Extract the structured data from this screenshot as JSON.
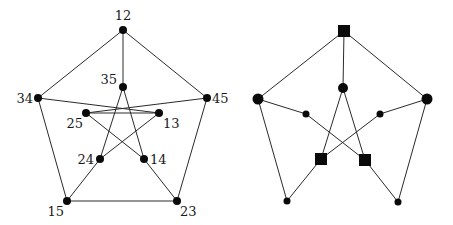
{
  "figure": {
    "left_graph": {
      "name": "Petersen graph (labeled)",
      "nodes": [
        {
          "id": "12",
          "label": "12",
          "x": 123,
          "y": 30,
          "lx": 123,
          "ly": 20,
          "anchor": "middle"
        },
        {
          "id": "35",
          "label": "35",
          "x": 123,
          "y": 87,
          "lx": 117,
          "ly": 84,
          "anchor": "end"
        },
        {
          "id": "34",
          "label": "34",
          "x": 38,
          "y": 98,
          "lx": 33,
          "ly": 103,
          "anchor": "end"
        },
        {
          "id": "45",
          "label": "45",
          "x": 207,
          "y": 98,
          "lx": 212,
          "ly": 103,
          "anchor": "start"
        },
        {
          "id": "25",
          "label": "25",
          "x": 86,
          "y": 113,
          "lx": 83,
          "ly": 128,
          "anchor": "end"
        },
        {
          "id": "13",
          "label": "13",
          "x": 159,
          "y": 113,
          "lx": 163,
          "ly": 128,
          "anchor": "start"
        },
        {
          "id": "24",
          "label": "24",
          "x": 100,
          "y": 159,
          "lx": 94,
          "ly": 164,
          "anchor": "end"
        },
        {
          "id": "14",
          "label": "14",
          "x": 144,
          "y": 159,
          "lx": 150,
          "ly": 164,
          "anchor": "start"
        },
        {
          "id": "15",
          "label": "15",
          "x": 67,
          "y": 201,
          "lx": 64,
          "ly": 216,
          "anchor": "end"
        },
        {
          "id": "23",
          "label": "23",
          "x": 177,
          "y": 201,
          "lx": 180,
          "ly": 216,
          "anchor": "start"
        }
      ],
      "edges": [
        [
          "12",
          "34"
        ],
        [
          "12",
          "45"
        ],
        [
          "12",
          "35"
        ],
        [
          "34",
          "15"
        ],
        [
          "45",
          "23"
        ],
        [
          "15",
          "23"
        ],
        [
          "34",
          "13"
        ],
        [
          "45",
          "25"
        ],
        [
          "25",
          "13"
        ],
        [
          "35",
          "24"
        ],
        [
          "35",
          "14"
        ],
        [
          "25",
          "14"
        ],
        [
          "13",
          "24"
        ],
        [
          "24",
          "15"
        ],
        [
          "14",
          "23"
        ]
      ]
    },
    "right_graph": {
      "name": "Petersen-like graph (shape-coded)",
      "nodes": [
        {
          "id": "top",
          "shape": "square",
          "size": 12,
          "x": 344,
          "y": 31
        },
        {
          "id": "center",
          "shape": "circle",
          "r": 5,
          "x": 343,
          "y": 88
        },
        {
          "id": "left",
          "shape": "circle",
          "r": 5.5,
          "x": 258,
          "y": 99
        },
        {
          "id": "right",
          "shape": "circle",
          "r": 5.5,
          "x": 427,
          "y": 99
        },
        {
          "id": "inner_left",
          "shape": "circle",
          "r": 3.5,
          "x": 306,
          "y": 114
        },
        {
          "id": "inner_right",
          "shape": "circle",
          "r": 3.5,
          "x": 380,
          "y": 114
        },
        {
          "id": "sq_left",
          "shape": "square",
          "size": 12,
          "x": 321,
          "y": 159
        },
        {
          "id": "sq_right",
          "shape": "square",
          "size": 12,
          "x": 365,
          "y": 160
        },
        {
          "id": "bottom_left",
          "shape": "circle",
          "r": 3.5,
          "x": 287,
          "y": 201
        },
        {
          "id": "bottom_right",
          "shape": "circle",
          "r": 3.5,
          "x": 398,
          "y": 202
        }
      ],
      "edges": [
        [
          "top",
          "left"
        ],
        [
          "top",
          "right"
        ],
        [
          "top",
          "center"
        ],
        [
          "left",
          "bottom_left"
        ],
        [
          "right",
          "bottom_right"
        ],
        [
          "left",
          "inner_left"
        ],
        [
          "right",
          "inner_right"
        ],
        [
          "center",
          "sq_left"
        ],
        [
          "center",
          "sq_right"
        ],
        [
          "inner_left",
          "sq_right"
        ],
        [
          "inner_right",
          "sq_left"
        ],
        [
          "sq_left",
          "bottom_left"
        ],
        [
          "sq_right",
          "bottom_right"
        ]
      ]
    }
  }
}
